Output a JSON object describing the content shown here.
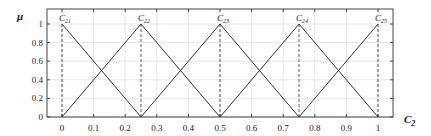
{
  "chart_data": {
    "type": "line",
    "title": "",
    "xlabel": "C",
    "xlabel_sub": "2",
    "ylabel": "μ",
    "xlim": [
      -0.05,
      1.05
    ],
    "ylim": [
      0,
      1.15
    ],
    "grid": true,
    "x_ticks": [
      0,
      0.1,
      0.2,
      0.3,
      0.4,
      0.5,
      0.6,
      0.7,
      0.8,
      0.9,
      1
    ],
    "x_tick_labels": [
      "0",
      "0.1",
      "0.2",
      "0.3",
      "0.4",
      "0.5",
      "0.6",
      "0.7",
      "0.8",
      "0.9",
      "1"
    ],
    "y_ticks": [
      0,
      0.2,
      0.4,
      0.6,
      0.8,
      1
    ],
    "y_tick_labels": [
      "0",
      "0.2",
      "0.4",
      "0.6",
      "0.8",
      "1"
    ],
    "series": [
      {
        "name": "C21",
        "label_main": "C",
        "label_sub": "21",
        "x": [
          0,
          0.25
        ],
        "y": [
          1,
          0
        ],
        "peak": 0
      },
      {
        "name": "C22",
        "label_main": "C",
        "label_sub": "22",
        "x": [
          0,
          0.25,
          0.5
        ],
        "y": [
          0,
          1,
          0
        ],
        "peak": 0.25
      },
      {
        "name": "C23",
        "label_main": "C",
        "label_sub": "23",
        "x": [
          0.25,
          0.5,
          0.75
        ],
        "y": [
          0,
          1,
          0
        ],
        "peak": 0.5
      },
      {
        "name": "C24",
        "label_main": "C",
        "label_sub": "24",
        "x": [
          0.5,
          0.75,
          1
        ],
        "y": [
          0,
          1,
          0
        ],
        "peak": 0.75
      },
      {
        "name": "C25",
        "label_main": "C",
        "label_sub": "25",
        "x": [
          0.75,
          1
        ],
        "y": [
          0,
          1
        ],
        "peak": 1
      }
    ],
    "annotations": "Dashed vertical lines drop from each peak (μ=1) to the x-axis at 0, 0.25, 0.5, 0.75, 1"
  },
  "colors": {
    "line": "#333333",
    "grid": "#e6e6e6",
    "axis": "#444444"
  }
}
